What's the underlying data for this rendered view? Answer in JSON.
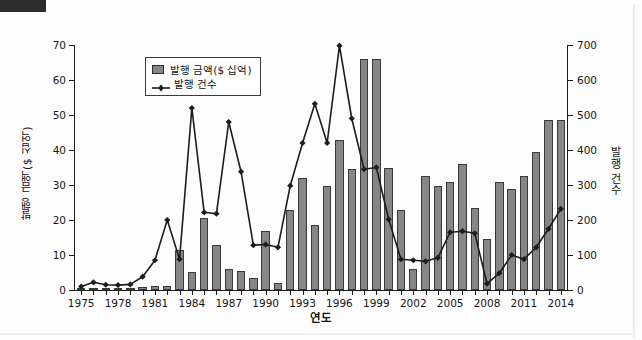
{
  "figure": {
    "x_axis_title": "연도",
    "y_axis_title_left": "발행 금액($ 십억)",
    "y_axis_title_right": "발행 건수"
  },
  "legend": {
    "items": [
      {
        "label": "발행 금액($ 십억)",
        "marker": "bar-swatch",
        "color": "#868686"
      },
      {
        "label": "발행 건수",
        "marker": "line-diamond-marker",
        "color": "#1c1c1c"
      }
    ]
  },
  "axes": {
    "left_ticks": [
      "0",
      "10",
      "20",
      "30",
      "40",
      "50",
      "60",
      "70"
    ],
    "right_ticks": [
      "0",
      "100",
      "200",
      "300",
      "400",
      "500",
      "600",
      "700"
    ],
    "x_ticks": [
      "1975",
      "1978",
      "1981",
      "1984",
      "1987",
      "1990",
      "1993",
      "1996",
      "1999",
      "2002",
      "2005",
      "2008",
      "2011",
      "2014"
    ]
  },
  "colors": {
    "bar_fill": "#868686",
    "bar_stroke": "#3a3a3a",
    "line": "#1c1c1c",
    "axis": "#1c1c1c",
    "background": "#ffffff"
  },
  "chart_data": {
    "type": "bar",
    "title": "",
    "subtitle": "",
    "xlabel": "연도",
    "ylabel": "발행 금액($ 십억)",
    "ylabel_secondary": "발행 건수",
    "ylim": [
      0,
      70
    ],
    "ylim_secondary": [
      0,
      700
    ],
    "grid": false,
    "legend_position": "top-left",
    "categories": [
      "1975",
      "1976",
      "1977",
      "1978",
      "1979",
      "1980",
      "1981",
      "1982",
      "1983",
      "1984",
      "1985",
      "1986",
      "1987",
      "1988",
      "1989",
      "1990",
      "1991",
      "1992",
      "1993",
      "1994",
      "1995",
      "1996",
      "1997",
      "1998",
      "1999",
      "2000",
      "2001",
      "2002",
      "2003",
      "2004",
      "2005",
      "2006",
      "2007",
      "2008",
      "2009",
      "2010",
      "2011",
      "2012",
      "2013",
      "2014"
    ],
    "series": [
      {
        "name": "발행 금액($ 십억)",
        "type": "bar",
        "axis": "left",
        "unit": "$ 십억",
        "values": [
          0.3,
          0.4,
          0.4,
          0.5,
          0.5,
          0.8,
          1.1,
          1.2,
          11.5,
          5.2,
          20.5,
          12.8,
          6.0,
          5.3,
          3.4,
          16.8,
          2.1,
          22.8,
          32.0,
          18.5,
          29.8,
          43.0,
          34.5,
          66.0,
          66.0,
          35.0,
          23.0,
          6.0,
          32.5,
          29.8,
          31.0,
          36.0,
          23.5,
          14.5,
          31.0,
          28.8,
          32.5,
          39.5,
          48.5,
          48.5
        ]
      },
      {
        "name": "발행 건수",
        "type": "line",
        "axis": "right",
        "unit": "건",
        "values": [
          10,
          22,
          15,
          14,
          16,
          38,
          85,
          200,
          88,
          520,
          222,
          218,
          480,
          338,
          128,
          130,
          122,
          298,
          420,
          532,
          420,
          698,
          490,
          345,
          350,
          202,
          88,
          85,
          82,
          92,
          165,
          168,
          162,
          18,
          48,
          100,
          88,
          122,
          175,
          232
        ]
      }
    ]
  }
}
